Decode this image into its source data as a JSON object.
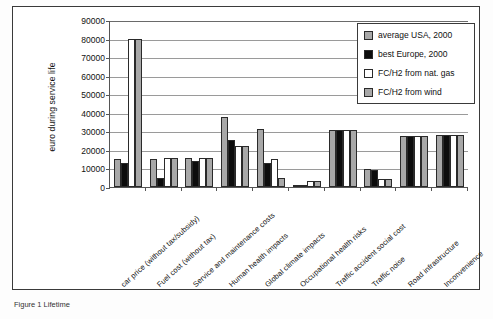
{
  "caption": "Figure 1  Lifetime",
  "chart_data": {
    "type": "bar",
    "title": "",
    "subtitle": "",
    "xlabel": "",
    "ylabel": "euro during service life",
    "ylim": [
      0,
      90000
    ],
    "ytick_step": 10000,
    "yticks": [
      "0",
      "10000",
      "20000",
      "30000",
      "40000",
      "50000",
      "60000",
      "70000",
      "80000",
      "90000"
    ],
    "grid": true,
    "legend_position": "top-right",
    "clipped_note": "Bars for 'car price' series 3 and 4 are clipped at 80000",
    "categories": [
      "car price (without tax/subsidy)",
      "Fuel cost (without tax)",
      "Service and maintenance costs",
      "Human health impacts",
      "Global climate impacts",
      "Occupational health risks",
      "Traffic accident social cost",
      "Traffic noise",
      "Road infrastructure",
      "Inconvenience"
    ],
    "series": [
      {
        "name": "average USA, 2000",
        "color": "#a8a8a8",
        "values": [
          15000,
          15000,
          15500,
          38000,
          31500,
          1000,
          30500,
          9500,
          27500,
          28000
        ]
      },
      {
        "name": "best Europe, 2000",
        "color": "#0d0d0d",
        "values": [
          13000,
          5000,
          14000,
          25500,
          13000,
          1000,
          30500,
          9000,
          27500,
          28000
        ]
      },
      {
        "name": "FC/H2 from nat. gas",
        "color": "#ffffff",
        "values": [
          80000,
          15500,
          15500,
          22000,
          15000,
          3000,
          30500,
          4500,
          27500,
          28000
        ]
      },
      {
        "name": "FC/H2 from wind",
        "color": "#a8a8a8",
        "values": [
          80000,
          15500,
          15500,
          22000,
          5000,
          3000,
          30500,
          4500,
          27500,
          28000
        ]
      }
    ]
  },
  "legend": {
    "items": [
      {
        "label": "average USA, 2000",
        "swatch": "#a8a8a8"
      },
      {
        "label": "best Europe, 2000",
        "swatch": "#0d0d0d"
      },
      {
        "label": "FC/H2 from nat. gas",
        "swatch": "#ffffff"
      },
      {
        "label": "FC/H2 from wind",
        "swatch": "#a8a8a8"
      }
    ]
  }
}
